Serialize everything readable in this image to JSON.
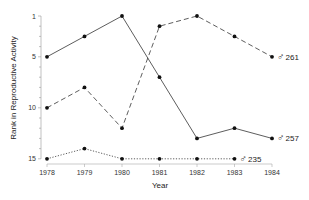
{
  "chart_data": {
    "type": "line",
    "title": "",
    "xlabel": "Year",
    "ylabel": "Rank in Reproductive Activity",
    "x": [
      1978,
      1979,
      1980,
      1981,
      1982,
      1983,
      1984
    ],
    "x_tick_labels": [
      "1978",
      "1979",
      "1980",
      "1981",
      "1982",
      "1983",
      "1984"
    ],
    "y_tick_labels": [
      "1",
      "5",
      "10",
      "15"
    ],
    "ylim": [
      15,
      1
    ],
    "y_inverted": true,
    "grid": false,
    "legend": "inline labels at series ends",
    "series": [
      {
        "name": "♂ 257",
        "label": "257",
        "style": "solid",
        "values": [
          5,
          3,
          1,
          7,
          13,
          12,
          13
        ]
      },
      {
        "name": "♂ 261",
        "label": "261",
        "style": "dashed",
        "values": [
          10,
          8,
          12,
          2,
          1,
          3,
          5
        ]
      },
      {
        "name": "♂ 235",
        "label": "235",
        "style": "dotted",
        "values": [
          15,
          14,
          15,
          15,
          15,
          15,
          null
        ]
      }
    ]
  },
  "labels": {
    "xlabel": "Year",
    "ylabel": "Rank in Reproductive Activity",
    "male_symbol": "♂"
  }
}
